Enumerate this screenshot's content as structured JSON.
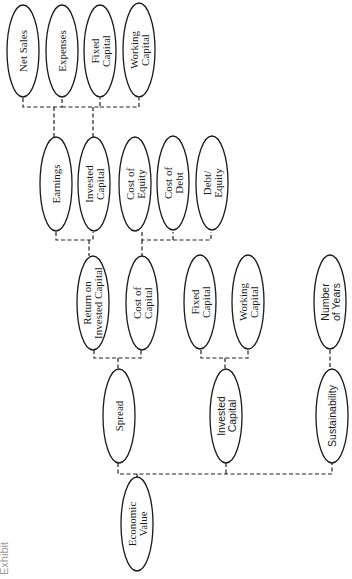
{
  "title": {
    "text_fragment": "Exhibit",
    "note": "clipped at left edge, rotated"
  },
  "orientation": "rotated 90° counter-clockwise (text reads bottom-to-top)",
  "nodes": {
    "economic_value": {
      "label_lines": [
        "Economic",
        "Value"
      ]
    },
    "spread": {
      "label_lines": [
        "Spread"
      ]
    },
    "invested_capital_l1": {
      "label_lines": [
        "Invested",
        "Capital"
      ]
    },
    "sustainability": {
      "label_lines": [
        "Sustainability"
      ]
    },
    "roic": {
      "label_lines": [
        "Return on",
        "Invested Capital"
      ]
    },
    "cost_of_capital": {
      "label_lines": [
        "Cost of",
        "Capital"
      ]
    },
    "fixed_capital_l2": {
      "label_lines": [
        "Fixed",
        "Capital"
      ]
    },
    "working_capital_l2": {
      "label_lines": [
        "Working",
        "Capital"
      ]
    },
    "number_of_years": {
      "label_lines": [
        "Number",
        "of Years"
      ]
    },
    "earnings": {
      "label_lines": [
        "Earnings"
      ]
    },
    "invested_capital_l3": {
      "label_lines": [
        "Invested",
        "Capital"
      ]
    },
    "cost_of_equity": {
      "label_lines": [
        "Cost of",
        "Equity"
      ]
    },
    "cost_of_debt": {
      "label_lines": [
        "Cost of",
        "Debt"
      ]
    },
    "debt_equity": {
      "label_lines": [
        "Debt/",
        "Equity"
      ]
    },
    "net_sales": {
      "label_lines": [
        "Net Sales"
      ]
    },
    "expenses": {
      "label_lines": [
        "Expenses"
      ]
    },
    "fixed_capital_l4": {
      "label_lines": [
        "Fixed",
        "Capital"
      ]
    },
    "working_capital_l4": {
      "label_lines": [
        "Working",
        "Capital"
      ]
    }
  },
  "edges": [
    {
      "parent": "economic_value",
      "children": [
        "spread",
        "invested_capital_l1",
        "sustainability"
      ]
    },
    {
      "parent": "spread",
      "children": [
        "roic",
        "cost_of_capital"
      ]
    },
    {
      "parent": "invested_capital_l1",
      "children": [
        "fixed_capital_l2",
        "working_capital_l2"
      ]
    },
    {
      "parent": "sustainability",
      "children": [
        "number_of_years"
      ]
    },
    {
      "parent": "roic",
      "children": [
        "earnings",
        "invested_capital_l3"
      ]
    },
    {
      "parent": "cost_of_capital",
      "children": [
        "cost_of_equity",
        "cost_of_debt",
        "debt_equity"
      ]
    },
    {
      "parent": "earnings",
      "children": [
        "net_sales",
        "expenses"
      ]
    },
    {
      "parent": "invested_capital_l3",
      "children": [
        "fixed_capital_l4",
        "working_capital_l4"
      ]
    }
  ],
  "style": {
    "line_color": "#222222",
    "connector": "dashed"
  }
}
